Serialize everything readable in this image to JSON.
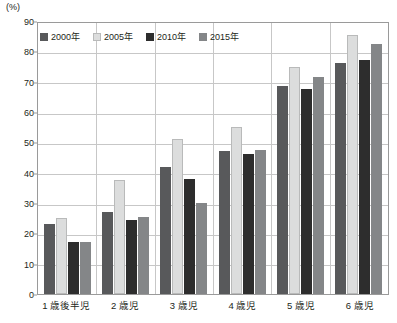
{
  "chart_data": {
    "type": "bar",
    "title": "",
    "xlabel": "",
    "ylabel": "(%)",
    "unit_label": "(%)",
    "ylim": [
      0,
      90
    ],
    "ytick_step": 10,
    "yticks": [
      0,
      10,
      20,
      30,
      40,
      50,
      60,
      70,
      80,
      90
    ],
    "grid": true,
    "legend_position": "top-left-inside",
    "categories": [
      "1 歳後半児",
      "2 歳児",
      "3 歳児",
      "4 歳児",
      "5 歳児",
      "6 歳児"
    ],
    "series": [
      {
        "name": "2000年",
        "color": "#58595b",
        "values": [
          23,
          27,
          42,
          47,
          68.5,
          76
        ]
      },
      {
        "name": "2005年",
        "color": "#dcdddd",
        "values": [
          25,
          37.5,
          51,
          55,
          75,
          85.5
        ]
      },
      {
        "name": "2010年",
        "color": "#2d2d2d",
        "values": [
          17,
          24.5,
          38,
          46,
          67.5,
          77
        ]
      },
      {
        "name": "2015年",
        "color": "#848688",
        "values": [
          17,
          25.5,
          30,
          47.5,
          71.5,
          82.5
        ]
      }
    ]
  }
}
